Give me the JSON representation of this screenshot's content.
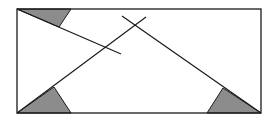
{
  "diagram": {
    "type": "geometry-figure",
    "colors": {
      "background": "#ffffff",
      "stroke": "#1a1a1a",
      "fill": "#8c8c8c"
    },
    "rectangle": {
      "x": 17,
      "y": 9,
      "width": 244,
      "height": 104
    },
    "shaded_triangles": [
      {
        "name": "top-left",
        "points": [
          [
            17,
            9
          ],
          [
            71,
            9
          ],
          [
            59,
            27
          ]
        ]
      },
      {
        "name": "bottom-left",
        "points": [
          [
            17,
            113
          ],
          [
            54,
            87
          ],
          [
            71,
            113
          ]
        ]
      },
      {
        "name": "bottom-right",
        "points": [
          [
            261,
            113
          ],
          [
            223,
            88
          ],
          [
            207,
            113
          ]
        ]
      }
    ],
    "lines": [
      {
        "name": "top-left-diagonal",
        "from": [
          17,
          9
        ],
        "to": [
          121,
          54
        ]
      },
      {
        "name": "bottom-left-diagonal",
        "from": [
          17,
          113
        ],
        "to": [
          146,
          17
        ]
      },
      {
        "name": "bottom-right-diagonal",
        "from": [
          122,
          16
        ],
        "to": [
          261,
          113
        ]
      }
    ]
  }
}
